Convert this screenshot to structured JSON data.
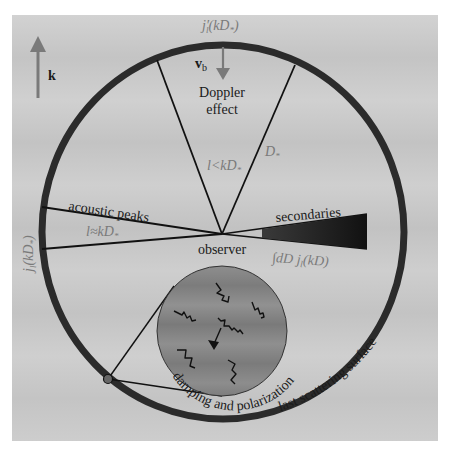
{
  "diagram": {
    "type": "CMB anisotropy sources schematic",
    "wave_vector": {
      "label": "k",
      "icon": "arrow-up-icon"
    },
    "doppler": {
      "title_line1": "Doppler",
      "title_line2": "effect",
      "velocity_label": "v",
      "velocity_subscript": "b",
      "projection_top": "j′",
      "projection_top_rest": "(kD",
      "projection_top_sub": "*",
      "projection_top_close": ")",
      "condition": "l<kD",
      "condition_sub": "*",
      "distance": "D",
      "distance_sub": "*"
    },
    "acoustic": {
      "title": "acoustic peaks",
      "condition": "l≈kD",
      "condition_sub": "*",
      "projection_side": "j",
      "projection_side_sub": "l",
      "projection_side_rest": "(kD",
      "projection_side_star": "*",
      "projection_side_close": ")"
    },
    "observer": {
      "label": "observer"
    },
    "secondaries": {
      "title": "secondaries",
      "integral": "∫dD j",
      "integral_sub": "l",
      "integral_rest": "(kD)"
    },
    "inset": {
      "label": "damping and polarization"
    },
    "surface": {
      "label": "last scattering surface"
    },
    "colors": {
      "background": "#c9c9c9",
      "ring": "#2b2b2b",
      "inset_fill": "#8a8a8a",
      "annotation_gray": "#7a7a7a",
      "arrow_gray": "#7a7a7a",
      "line": "#111111"
    }
  }
}
